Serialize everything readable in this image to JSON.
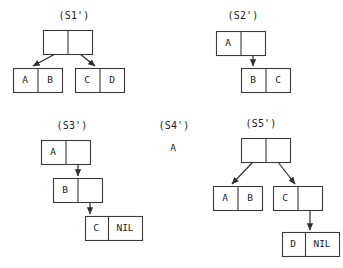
{
  "page": {
    "background_color": "#ffffff",
    "line_color": "#3a3a3a",
    "text_color": "#1b1b1b",
    "width": 343,
    "height": 268
  },
  "diagrams": [
    {
      "id": "s1",
      "label": "(S1')",
      "label_x": 74,
      "label_y": 16,
      "nodes": [
        {
          "name": "s1-root",
          "x": 43,
          "y": 30,
          "w": 49,
          "h": 24,
          "divider_x": 67.5,
          "cells": [
            {
              "text": "",
              "cx": 55,
              "cy": 42
            },
            {
              "text": "",
              "cx": 80,
              "cy": 42
            }
          ]
        },
        {
          "name": "s1-left-leaf",
          "x": 13,
          "y": 68,
          "w": 49,
          "h": 24,
          "divider_x": 37.5,
          "cells": [
            {
              "text": "A",
              "cx": 25,
              "cy": 80
            },
            {
              "text": "B",
              "cx": 50,
              "cy": 80
            }
          ]
        },
        {
          "name": "s1-right-leaf",
          "x": 75,
          "y": 68,
          "w": 49,
          "h": 24,
          "divider_x": 99.5,
          "cells": [
            {
              "text": "C",
              "cx": 87,
              "cy": 80
            },
            {
              "text": "D",
              "cx": 112,
              "cy": 80
            }
          ]
        }
      ],
      "arrows": [
        {
          "name": "s1-car-arrow",
          "x1": 55,
          "y1": 54,
          "x2": 33,
          "y2": 66
        },
        {
          "name": "s1-cdr-arrow",
          "x1": 80,
          "y1": 54,
          "x2": 95,
          "y2": 66
        }
      ]
    },
    {
      "id": "s2",
      "label": "(S2')",
      "label_x": 243,
      "label_y": 16,
      "nodes": [
        {
          "name": "s2-root",
          "x": 216,
          "y": 31,
          "w": 49,
          "h": 24,
          "divider_x": 240.5,
          "cells": [
            {
              "text": "A",
              "cx": 228,
              "cy": 43
            },
            {
              "text": "",
              "cx": 253,
              "cy": 43
            }
          ]
        },
        {
          "name": "s2-tail",
          "x": 241,
          "y": 68,
          "w": 49,
          "h": 24,
          "divider_x": 265.5,
          "cells": [
            {
              "text": "B",
              "cx": 253,
              "cy": 80
            },
            {
              "text": "C",
              "cx": 278,
              "cy": 80
            }
          ]
        }
      ],
      "arrows": [
        {
          "name": "s2-cdr-arrow",
          "x1": 253,
          "y1": 55,
          "x2": 253,
          "y2": 66
        }
      ]
    },
    {
      "id": "s3",
      "label": "(S3')",
      "label_x": 72,
      "label_y": 126,
      "nodes": [
        {
          "name": "s3-node-a",
          "x": 41,
          "y": 140,
          "w": 49,
          "h": 24,
          "divider_x": 65.5,
          "cells": [
            {
              "text": "A",
              "cx": 53,
              "cy": 152
            },
            {
              "text": "",
              "cx": 78,
              "cy": 152
            }
          ]
        },
        {
          "name": "s3-node-b",
          "x": 53,
          "y": 178,
          "w": 49,
          "h": 24,
          "divider_x": 77.5,
          "cells": [
            {
              "text": "B",
              "cx": 65,
              "cy": 190
            },
            {
              "text": "",
              "cx": 90,
              "cy": 190
            }
          ]
        },
        {
          "name": "s3-node-c",
          "x": 85,
          "y": 216,
          "w": 57,
          "h": 24,
          "divider_x": 108,
          "cells": [
            {
              "text": "C",
              "cx": 96,
              "cy": 228
            },
            {
              "text": "NIL",
              "cx": 125,
              "cy": 228
            }
          ]
        }
      ],
      "arrows": [
        {
          "name": "s3-a-cdr-arrow",
          "x1": 78,
          "y1": 164,
          "x2": 78,
          "y2": 176
        },
        {
          "name": "s3-b-cdr-arrow",
          "x1": 90,
          "y1": 202,
          "x2": 90,
          "y2": 214
        }
      ]
    },
    {
      "id": "s4",
      "label": "(S4')",
      "label_x": 174,
      "label_y": 126,
      "atom": {
        "name": "s4-atom",
        "text": "A",
        "x": 173,
        "y": 148
      },
      "nodes": [],
      "arrows": []
    },
    {
      "id": "s5",
      "label": "(S5')",
      "label_x": 261,
      "label_y": 124,
      "nodes": [
        {
          "name": "s5-root",
          "x": 241,
          "y": 138,
          "w": 49,
          "h": 24,
          "divider_x": 265.5,
          "cells": [
            {
              "text": "",
              "cx": 253,
              "cy": 150
            },
            {
              "text": "",
              "cx": 278,
              "cy": 150
            }
          ]
        },
        {
          "name": "s5-left-leaf",
          "x": 213,
          "y": 186,
          "w": 49,
          "h": 24,
          "divider_x": 237.5,
          "cells": [
            {
              "text": "A",
              "cx": 225,
              "cy": 198
            },
            {
              "text": "B",
              "cx": 250,
              "cy": 198
            }
          ]
        },
        {
          "name": "s5-right-node",
          "x": 273,
          "y": 186,
          "w": 49,
          "h": 24,
          "divider_x": 297.5,
          "cells": [
            {
              "text": "C",
              "cx": 285,
              "cy": 198
            },
            {
              "text": "",
              "cx": 310,
              "cy": 198
            }
          ]
        },
        {
          "name": "s5-tail-node",
          "x": 282,
          "y": 232,
          "w": 57,
          "h": 24,
          "divider_x": 305,
          "cells": [
            {
              "text": "D",
              "cx": 293,
              "cy": 244
            },
            {
              "text": "NIL",
              "cx": 322,
              "cy": 244
            }
          ]
        }
      ],
      "arrows": [
        {
          "name": "s5-car-arrow",
          "x1": 253,
          "y1": 162,
          "x2": 232,
          "y2": 184
        },
        {
          "name": "s5-cdr-arrow",
          "x1": 278,
          "y1": 162,
          "x2": 295,
          "y2": 184
        },
        {
          "name": "s5-c-cdr-arrow",
          "x1": 310,
          "y1": 210,
          "x2": 310,
          "y2": 230
        }
      ]
    }
  ]
}
